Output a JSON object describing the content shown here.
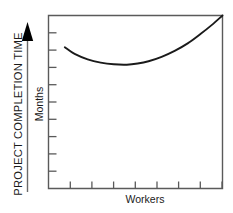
{
  "chart_data": {
    "type": "line",
    "title": "",
    "subtitle": "",
    "axis_caption": "PROJECT COMPLETION TIME",
    "ylabel": "Months",
    "xlabel": "Workers",
    "grid": false,
    "legend": null,
    "xlim": [
      0,
      8
    ],
    "ylim": [
      0,
      9
    ],
    "xticks": [
      1,
      2,
      3,
      4,
      5,
      6,
      7,
      8
    ],
    "yticks": [
      1,
      2,
      3,
      4,
      5,
      6,
      7,
      8,
      9
    ],
    "xtick_labels": [
      "",
      "",
      "",
      "",
      "",
      "",
      "",
      ""
    ],
    "ytick_labels": [
      "",
      "",
      "",
      "",
      "",
      "",
      "",
      "",
      ""
    ],
    "series": [
      {
        "name": "Project completion time",
        "x": [
          0.75,
          1.2,
          1.8,
          2.4,
          3.0,
          3.6,
          4.1,
          4.6,
          5.2,
          5.8,
          6.4,
          7.0,
          7.5,
          8.0
        ],
        "y": [
          7.35,
          7.0,
          6.72,
          6.55,
          6.46,
          6.44,
          6.5,
          6.62,
          6.85,
          7.16,
          7.55,
          8.05,
          8.5,
          9.0
        ]
      }
    ],
    "annotation": "U-shaped curve: completion time falls to a minimum then rises as more workers are added",
    "colors": {
      "curve": "#1a1a1a",
      "frame": "#4a4a4a",
      "arrow": "#000000",
      "background": "#ffffff",
      "text": "#1a1a1a"
    }
  },
  "labels": {
    "axis_caption": "PROJECT COMPLETION TIME",
    "ylabel": "Months",
    "xlabel": "Workers"
  }
}
